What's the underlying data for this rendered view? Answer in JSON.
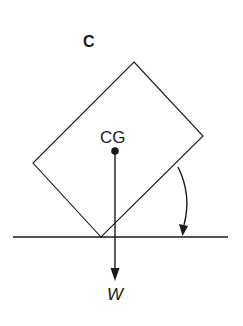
{
  "diagram": {
    "panel_label": "C",
    "center_of_gravity_label": "CG",
    "weight_label": "W",
    "colors": {
      "stroke": "#1a1a1a",
      "background": "#ffffff"
    },
    "block": {
      "shape": "rectangle rotated about bottom corner",
      "corners": [
        [
          134,
          62
        ],
        [
          203,
          136
        ],
        [
          101,
          237
        ],
        [
          33,
          163
        ]
      ]
    },
    "ground_line": {
      "x1": 13,
      "x2": 228,
      "y": 237
    },
    "cg_point": [
      115,
      151
    ],
    "weight_vector": {
      "from": [
        115,
        151
      ],
      "to": [
        115,
        280
      ],
      "direction": "down"
    },
    "rotation_arrow": {
      "direction": "clockwise",
      "from": [
        178,
        167
      ],
      "to": [
        183,
        235
      ]
    }
  }
}
